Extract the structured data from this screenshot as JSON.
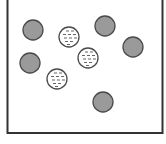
{
  "diagram": {
    "frame": {
      "x": 7.5,
      "y": -2,
      "width": 155,
      "height": 135,
      "stroke": "#333333",
      "stroke_width": 2
    },
    "legend": {
      "solid": "gray particle",
      "patterned": "dashed-pattern particle"
    },
    "colors": {
      "solid_fill": "#9a9a9a",
      "solid_stroke": "#4a4a4a",
      "patterned_fill": "#ffffff",
      "patterned_stroke": "#4a4a4a",
      "pattern_dash": "#555555"
    },
    "particles": [
      {
        "type": "solid",
        "cx": 33,
        "cy": 30,
        "r": 10
      },
      {
        "type": "solid",
        "cx": 105,
        "cy": 26,
        "r": 10
      },
      {
        "type": "solid",
        "cx": 133,
        "cy": 47,
        "r": 10
      },
      {
        "type": "solid",
        "cx": 30,
        "cy": 63,
        "r": 10
      },
      {
        "type": "solid",
        "cx": 103,
        "cy": 102,
        "r": 10
      },
      {
        "type": "patterned",
        "cx": 69,
        "cy": 37,
        "r": 10
      },
      {
        "type": "patterned",
        "cx": 88,
        "cy": 58,
        "r": 10
      },
      {
        "type": "patterned",
        "cx": 57,
        "cy": 79,
        "r": 10
      }
    ]
  }
}
